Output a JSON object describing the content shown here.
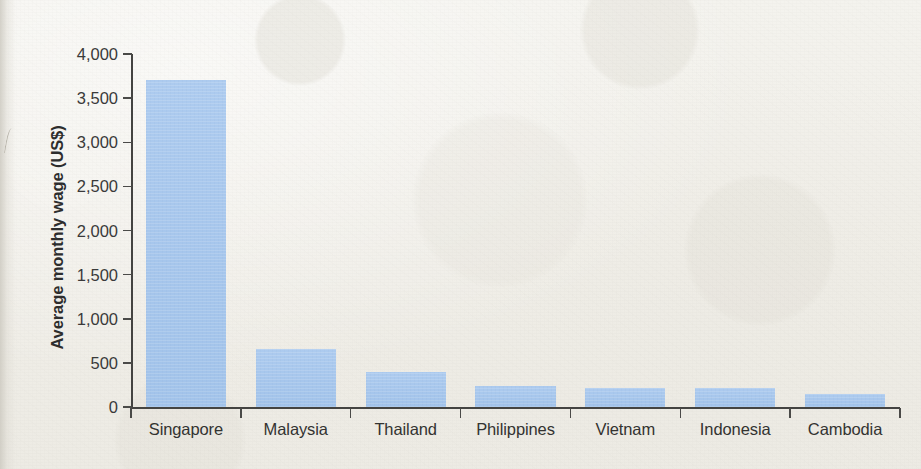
{
  "chart_data": {
    "type": "bar",
    "title": "",
    "xlabel": "",
    "ylabel": "Average monthly wage (US$)",
    "categories": [
      "Singapore",
      "Malaysia",
      "Thailand",
      "Philippines",
      "Vietnam",
      "Indonesia",
      "Cambodia"
    ],
    "values": [
      3700,
      660,
      400,
      240,
      220,
      215,
      150
    ],
    "ylim": [
      0,
      4000
    ],
    "ytick_values": [
      0,
      500,
      1000,
      1500,
      2000,
      2500,
      3000,
      3500,
      4000
    ],
    "ytick_labels": [
      "0",
      "500",
      "1,000",
      "1,500",
      "2,000",
      "2,500",
      "3,000",
      "3,500",
      "4,000"
    ],
    "grid": false,
    "legend": false,
    "series": [
      {
        "name": "Average monthly wage (US$)",
        "values": [
          3700,
          660,
          400,
          240,
          220,
          215,
          150
        ]
      }
    ],
    "bar_color": "#a9c9ee",
    "axis_color": "#444442",
    "text_color": "#333331",
    "background_color": "#f1efe9"
  }
}
